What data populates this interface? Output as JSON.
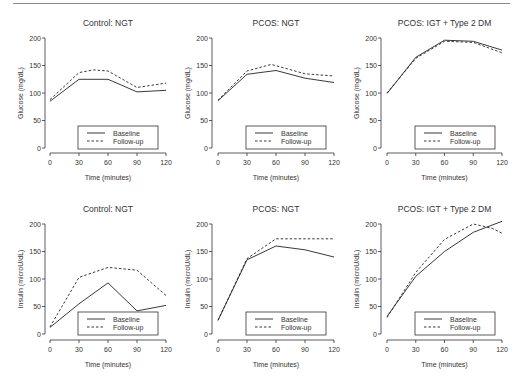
{
  "figure": {
    "legend": {
      "baseline": "Baseline",
      "followup": "Follow-up"
    },
    "xlabel": "Time (minutes)",
    "colors": {
      "line": "#222222",
      "axis": "#333333",
      "text": "#333333",
      "rule": "#8a8a8a"
    }
  },
  "chart_data": [
    {
      "type": "line",
      "title": "Control: NGT",
      "xlabel": "Time (minutes)",
      "ylabel": "Glucose (mg/dL)",
      "x": [
        0,
        30,
        60,
        90,
        120
      ],
      "xticks": [
        0,
        30,
        60,
        90,
        120
      ],
      "yticks": [
        0,
        50,
        100,
        150,
        200
      ],
      "ylim": [
        0,
        200
      ],
      "xlim": [
        0,
        120
      ],
      "series": [
        {
          "name": "Baseline",
          "style": "solid",
          "x": [
            0,
            30,
            60,
            90,
            120
          ],
          "values": [
            85,
            125,
            125,
            102,
            105
          ]
        },
        {
          "name": "Follow-up",
          "style": "dashed",
          "x": [
            0,
            30,
            45,
            60,
            90,
            120
          ],
          "values": [
            88,
            137,
            142,
            140,
            110,
            118
          ]
        }
      ],
      "legend_position": "lower right",
      "grid": false
    },
    {
      "type": "line",
      "title": "PCOS: NGT",
      "xlabel": "Time (minutes)",
      "ylabel": "Glucose (mg/dL)",
      "x": [
        0,
        30,
        60,
        90,
        120
      ],
      "xticks": [
        0,
        30,
        60,
        90,
        120
      ],
      "yticks": [
        0,
        50,
        100,
        150,
        200
      ],
      "ylim": [
        0,
        200
      ],
      "xlim": [
        0,
        120
      ],
      "series": [
        {
          "name": "Baseline",
          "style": "solid",
          "x": [
            0,
            30,
            60,
            90,
            120
          ],
          "values": [
            86,
            134,
            141,
            127,
            119
          ]
        },
        {
          "name": "Follow-up",
          "style": "dashed",
          "x": [
            0,
            30,
            55,
            90,
            120
          ],
          "values": [
            87,
            140,
            152,
            135,
            131
          ]
        }
      ],
      "legend_position": "lower right",
      "grid": false
    },
    {
      "type": "line",
      "title": "PCOS: IGT + Type 2 DM",
      "xlabel": "Time (minutes)",
      "ylabel": "Glucose (mg/dL)",
      "x": [
        0,
        30,
        60,
        90,
        120
      ],
      "xticks": [
        0,
        30,
        60,
        90,
        120
      ],
      "yticks": [
        0,
        50,
        100,
        150,
        200
      ],
      "ylim": [
        0,
        200
      ],
      "xlim": [
        0,
        120
      ],
      "series": [
        {
          "name": "Baseline",
          "style": "solid",
          "x": [
            0,
            30,
            60,
            90,
            120
          ],
          "values": [
            99,
            165,
            196,
            194,
            178
          ]
        },
        {
          "name": "Follow-up",
          "style": "dashed",
          "x": [
            0,
            30,
            60,
            90,
            120
          ],
          "values": [
            100,
            163,
            194,
            192,
            173
          ]
        }
      ],
      "legend_position": "lower right",
      "grid": false
    },
    {
      "type": "line",
      "title": "Control: NGT",
      "xlabel": "Time (minutes)",
      "ylabel": "Insulin (microU/dL)",
      "x": [
        0,
        30,
        60,
        90,
        120
      ],
      "xticks": [
        0,
        30,
        60,
        90,
        120
      ],
      "yticks": [
        0,
        50,
        100,
        150,
        200
      ],
      "ylim": [
        0,
        200
      ],
      "xlim": [
        0,
        120
      ],
      "series": [
        {
          "name": "Baseline",
          "style": "solid",
          "x": [
            0,
            30,
            60,
            90,
            120
          ],
          "values": [
            12,
            55,
            93,
            42,
            52
          ]
        },
        {
          "name": "Follow-up",
          "style": "dashed",
          "x": [
            0,
            30,
            60,
            90,
            120
          ],
          "values": [
            13,
            103,
            121,
            116,
            70
          ]
        }
      ],
      "legend_position": "lower right",
      "grid": false
    },
    {
      "type": "line",
      "title": "PCOS: NGT",
      "xlabel": "Time (minutes)",
      "ylabel": "Insulin (microU/dL)",
      "x": [
        0,
        30,
        60,
        90,
        120
      ],
      "xticks": [
        0,
        30,
        60,
        90,
        120
      ],
      "yticks": [
        0,
        50,
        100,
        150,
        200
      ],
      "ylim": [
        0,
        200
      ],
      "xlim": [
        0,
        120
      ],
      "series": [
        {
          "name": "Baseline",
          "style": "solid",
          "x": [
            0,
            30,
            60,
            90,
            120
          ],
          "values": [
            25,
            135,
            160,
            153,
            140
          ]
        },
        {
          "name": "Follow-up",
          "style": "dashed",
          "x": [
            0,
            30,
            60,
            90,
            120
          ],
          "values": [
            25,
            137,
            173,
            173,
            173
          ]
        }
      ],
      "legend_position": "lower right",
      "grid": false
    },
    {
      "type": "line",
      "title": "PCOS: IGT + Type 2 DM",
      "xlabel": "Time (minutes)",
      "ylabel": "Insulin (microU/dL)",
      "x": [
        0,
        30,
        60,
        90,
        120
      ],
      "xticks": [
        0,
        30,
        60,
        90,
        120
      ],
      "yticks": [
        0,
        50,
        100,
        150,
        200
      ],
      "ylim": [
        0,
        200
      ],
      "xlim": [
        0,
        120
      ],
      "series": [
        {
          "name": "Baseline",
          "style": "solid",
          "x": [
            0,
            30,
            60,
            90,
            120
          ],
          "values": [
            32,
            105,
            150,
            185,
            205
          ]
        },
        {
          "name": "Follow-up",
          "style": "dashed",
          "x": [
            0,
            30,
            60,
            90,
            110,
            120
          ],
          "values": [
            30,
            112,
            172,
            200,
            192,
            183
          ]
        }
      ],
      "legend_position": "lower right",
      "grid": false
    }
  ]
}
